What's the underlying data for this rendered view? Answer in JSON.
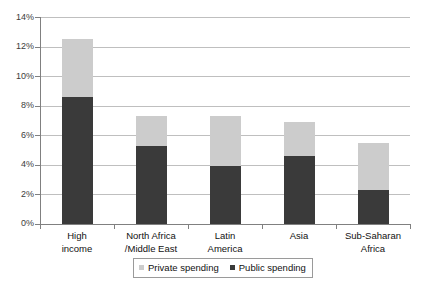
{
  "chart_data": {
    "type": "bar",
    "subtype": "stacked-vertical",
    "title": "",
    "xlabel": "",
    "ylabel": "",
    "ylim": [
      0,
      14
    ],
    "ytick_labels": [
      "0%",
      "2%",
      "4%",
      "6%",
      "8%",
      "10%",
      "12%",
      "14%"
    ],
    "ytick_values": [
      0,
      2,
      4,
      6,
      8,
      10,
      12,
      14
    ],
    "grid": true,
    "grid_axis": "y",
    "legend_position": "bottom-center",
    "categories": [
      "High income",
      "North Africa /Middle East",
      "Latin America",
      "Asia",
      "Sub-Saharan Africa"
    ],
    "category_lines": [
      [
        "High",
        "income"
      ],
      [
        "North Africa",
        "/Middle East"
      ],
      [
        "Latin",
        "America"
      ],
      [
        "Asia",
        ""
      ],
      [
        "Sub-Saharan",
        "Africa"
      ]
    ],
    "series": [
      {
        "name": "Public spending",
        "color": "#3a3a3a",
        "values": [
          8.6,
          5.3,
          3.9,
          4.6,
          2.3
        ]
      },
      {
        "name": "Private spending",
        "color": "#cccccc",
        "values": [
          3.9,
          2.0,
          3.4,
          2.3,
          3.2
        ]
      }
    ],
    "totals": [
      12.5,
      7.3,
      7.3,
      6.9,
      5.5
    ],
    "stack_order": [
      "Public spending",
      "Private spending"
    ]
  },
  "legend": {
    "items": [
      {
        "label": "Private spending",
        "color": "#cccccc"
      },
      {
        "label": "Public spending",
        "color": "#3a3a3a"
      }
    ]
  },
  "axis": {
    "y_labels": [
      "14%",
      "12%",
      "10%",
      "8%",
      "6%",
      "4%",
      "2%",
      "0%"
    ]
  },
  "colors": {
    "public": "#3a3a3a",
    "private": "#cccccc",
    "gridline": "#bfbfbf",
    "axis": "#808080",
    "text": "#111111",
    "background": "#ffffff"
  }
}
